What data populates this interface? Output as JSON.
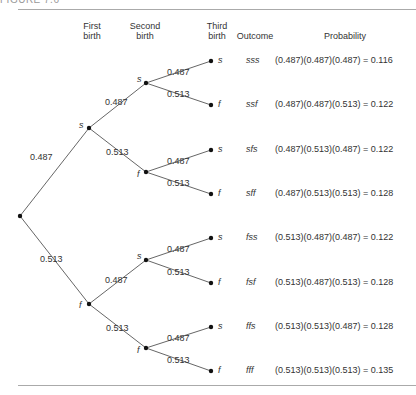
{
  "figure_label": "FIGURE 7.6",
  "headers": {
    "first_birth": [
      "First",
      "birth"
    ],
    "second_birth": [
      "Second",
      "birth"
    ],
    "third_birth": [
      "Third",
      "birth"
    ],
    "outcome": "Outcome",
    "probability": "Probability"
  },
  "tree": {
    "root": {
      "x": 20,
      "y": 216
    },
    "level1": [
      {
        "label": "s",
        "x": 89,
        "y": 128,
        "edge_prob": "0.487",
        "label_pos": [
          30,
          160
        ]
      },
      {
        "label": "f",
        "x": 89,
        "y": 304,
        "edge_prob": "0.513",
        "label_pos": [
          40,
          262
        ]
      }
    ],
    "level2": [
      {
        "parent": 0,
        "label": "s",
        "x": 146,
        "y": 83,
        "edge_prob": "0.487",
        "label_pos": [
          105,
          105
        ]
      },
      {
        "parent": 0,
        "label": "f",
        "x": 146,
        "y": 172,
        "edge_prob": "0.513",
        "label_pos": [
          106,
          155
        ]
      },
      {
        "parent": 1,
        "label": "s",
        "x": 146,
        "y": 260,
        "edge_prob": "0.487",
        "label_pos": [
          105,
          283
        ]
      },
      {
        "parent": 1,
        "label": "f",
        "x": 146,
        "y": 348,
        "edge_prob": "0.513",
        "label_pos": [
          106,
          331
        ]
      }
    ],
    "leaves": [
      {
        "parent": 0,
        "y": 61,
        "edge_prob": "0.487",
        "label_pos": [
          167,
          75
        ]
      },
      {
        "parent": 0,
        "y": 105,
        "edge_prob": "0.513",
        "label_pos": [
          167,
          97
        ]
      },
      {
        "parent": 1,
        "y": 150,
        "edge_prob": "0.487",
        "label_pos": [
          167,
          164
        ]
      },
      {
        "parent": 1,
        "y": 194,
        "edge_prob": "0.513",
        "label_pos": [
          167,
          186
        ]
      },
      {
        "parent": 2,
        "y": 238,
        "edge_prob": "0.487",
        "label_pos": [
          167,
          252
        ]
      },
      {
        "parent": 2,
        "y": 283,
        "edge_prob": "0.513",
        "label_pos": [
          167,
          275
        ]
      },
      {
        "parent": 3,
        "y": 327,
        "edge_prob": "0.487",
        "label_pos": [
          167,
          341
        ]
      },
      {
        "parent": 3,
        "y": 371,
        "edge_prob": "0.513",
        "label_pos": [
          167,
          363
        ]
      }
    ]
  },
  "rows": [
    {
      "third": "s",
      "outcome": "sss",
      "probability": "(0.487)(0.487)(0.487) = 0.116"
    },
    {
      "third": "f",
      "outcome": "ssf",
      "probability": "(0.487)(0.487)(0.513) = 0.122"
    },
    {
      "third": "s",
      "outcome": "sfs",
      "probability": "(0.487)(0.513)(0.487) = 0.122"
    },
    {
      "third": "f",
      "outcome": "sff",
      "probability": "(0.487)(0.513)(0.513) = 0.128"
    },
    {
      "third": "s",
      "outcome": "fss",
      "probability": "(0.513)(0.487)(0.487) = 0.122"
    },
    {
      "third": "f",
      "outcome": "fsf",
      "probability": "(0.513)(0.487)(0.513) = 0.128"
    },
    {
      "third": "s",
      "outcome": "ffs",
      "probability": "(0.513)(0.513)(0.487) = 0.128"
    },
    {
      "third": "f",
      "outcome": "fff",
      "probability": "(0.513)(0.513)(0.513) = 0.135"
    }
  ]
}
